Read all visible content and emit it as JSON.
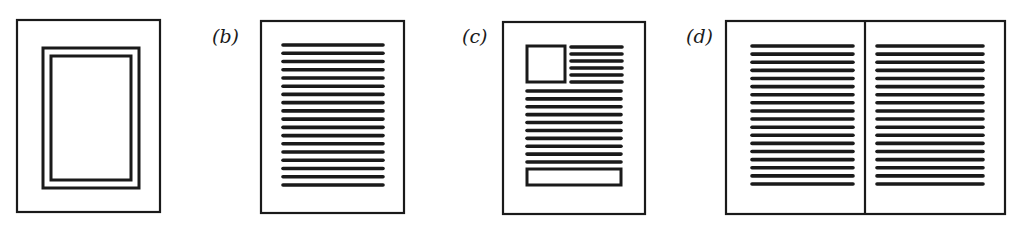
{
  "figure": {
    "panels": [
      {
        "id": "a",
        "label": "",
        "description": "Framed blank page: outer page border with a double-line inner frame",
        "outer": {
          "x": 17,
          "y": 20,
          "w": 143,
          "h": 192
        },
        "frames": [
          {
            "x": 43,
            "y": 48,
            "w": 96,
            "h": 140
          },
          {
            "x": 51,
            "y": 56,
            "w": 80,
            "h": 124
          }
        ]
      },
      {
        "id": "b",
        "label": "(b)",
        "label_pos": {
          "x": 212,
          "y": 27
        },
        "description": "Single page of continuous text lines",
        "outer": {
          "x": 261,
          "y": 21,
          "w": 143,
          "h": 192
        },
        "text_block": {
          "x1": 283,
          "x2": 383,
          "y_start": 45,
          "y_end": 185,
          "line_count": 18
        }
      },
      {
        "id": "c",
        "label": "(c)",
        "label_pos": {
          "x": 462,
          "y": 27
        },
        "description": "Page with picture box top-left, text beside and below it, and a caption box at the bottom",
        "outer": {
          "x": 503,
          "y": 22,
          "w": 142,
          "h": 192
        },
        "image_box": {
          "x": 527,
          "y": 46,
          "w": 38,
          "h": 36
        },
        "side_text": {
          "x1": 571,
          "x2": 622,
          "y_start": 47,
          "y_end": 82,
          "line_count": 6
        },
        "body_text": {
          "x1": 527,
          "x2": 621,
          "y_start": 91,
          "y_end": 162,
          "line_count": 10
        },
        "footer_box": {
          "x": 527,
          "y": 169,
          "w": 94,
          "h": 16
        }
      },
      {
        "id": "d",
        "label": "(d)",
        "label_pos": {
          "x": 686,
          "y": 27
        },
        "description": "Two-page spread with text columns on facing pages",
        "outer": {
          "x": 726,
          "y": 21,
          "w": 279,
          "h": 193
        },
        "divider_x": 865,
        "left_text": {
          "x1": 752,
          "x2": 853,
          "y_start": 46,
          "y_end": 184,
          "line_count": 18
        },
        "right_text": {
          "x1": 877,
          "x2": 983,
          "y_start": 46,
          "y_end": 184,
          "line_count": 18
        }
      }
    ],
    "stroke_color": "#1a1a1a",
    "background_color": "#ffffff"
  }
}
